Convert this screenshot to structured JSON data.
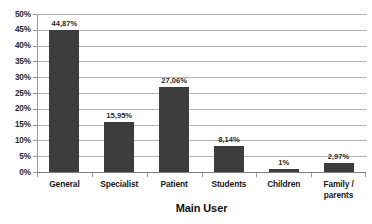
{
  "chart_data": {
    "type": "bar",
    "title": "",
    "xlabel": "Main User",
    "ylabel": "",
    "categories": [
      "General",
      "Specialist",
      "Patient",
      "Students",
      "Children",
      "Family / parents"
    ],
    "category_lines": [
      [
        "General"
      ],
      [
        "Specialist"
      ],
      [
        "Patient"
      ],
      [
        "Students"
      ],
      [
        "Children"
      ],
      [
        "Family /",
        "parents"
      ]
    ],
    "values": [
      44.87,
      15.95,
      27.06,
      8.14,
      1,
      2.97
    ],
    "data_labels": [
      "44,87%",
      "15,95%",
      "27,06%",
      "8,14%",
      "1%",
      "2,97%"
    ],
    "ylim": [
      0,
      50
    ],
    "ytick_values": [
      50,
      45,
      40,
      35,
      30,
      25,
      20,
      15,
      10,
      5,
      0
    ],
    "ytick_labels": [
      "50%",
      "45%",
      "40%",
      "35%",
      "30%",
      "25%",
      "20%",
      "15%",
      "10%",
      "5%",
      "0%"
    ],
    "grid": true,
    "legend": "none",
    "bar_color": "#3d3d3d",
    "gridline_color": "#b4b4b4",
    "axis_color": "#9a9a9a",
    "background_color": "#ffffff"
  }
}
